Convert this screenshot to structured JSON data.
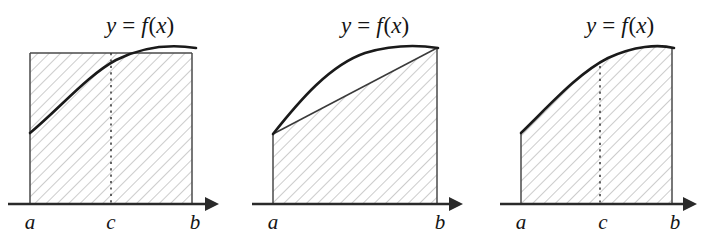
{
  "figure": {
    "background_color": "#ffffff",
    "curve_color": "#1a1a1a",
    "hatch_color": "#9a9a9a",
    "axis_color": "#2a2a2a"
  },
  "panels": [
    {
      "id": "left",
      "function_label": "y = f(x)",
      "function_label_parts": {
        "y": "y",
        "equals": "=",
        "f": "f",
        "open": "(",
        "x": "x",
        "close": ")"
      },
      "region_description": "rectangle of height f(c) over [a,b]",
      "axis_labels": [
        {
          "name": "a",
          "text": "a",
          "x": 30
        },
        {
          "name": "c",
          "text": "c",
          "x": 111
        },
        {
          "name": "b",
          "text": "b",
          "x": 195
        }
      ],
      "has_c_line": true,
      "geometry": {
        "x_a": 30,
        "x_c": 111,
        "x_b": 192,
        "y_base": 204,
        "y_top": 53,
        "curve": "M30,133 C60,108 88,75 116,60 C142,47 170,44 196,48",
        "axis_x_start": 8,
        "axis_x_end": 212,
        "axis_tip": 219
      }
    },
    {
      "id": "middle",
      "function_label": "y = f(x)",
      "function_label_parts": {
        "y": "y",
        "equals": "=",
        "f": "f",
        "open": "(",
        "x": "x",
        "close": ")"
      },
      "region_description": "trapezoid under chord from (a,f(a)) to (b,f(b))",
      "axis_labels": [
        {
          "name": "a",
          "text": "a",
          "x": 273
        },
        {
          "name": "b",
          "text": "b",
          "x": 440
        }
      ],
      "has_c_line": false,
      "geometry": {
        "x_a": 273,
        "x_b": 437,
        "y_base": 204,
        "y_fa": 134,
        "y_fb": 48,
        "curve": "M273,134 C300,100 330,65 365,53 C392,45 418,45 438,48",
        "axis_x_start": 252,
        "axis_x_end": 456,
        "axis_tip": 463
      }
    },
    {
      "id": "right",
      "function_label": "y = f(x)",
      "function_label_parts": {
        "y": "y",
        "equals": "=",
        "f": "f",
        "open": "(",
        "x": "x",
        "close": ")"
      },
      "region_description": "exact region under the curve over [a,b]",
      "axis_labels": [
        {
          "name": "a",
          "text": "a",
          "x": 521
        },
        {
          "name": "c",
          "text": "c",
          "x": 603
        },
        {
          "name": "b",
          "text": "b",
          "x": 675
        }
      ],
      "has_c_line": true,
      "geometry": {
        "x_a": 521,
        "x_c": 600,
        "x_b": 672,
        "y_base": 204,
        "y_fa": 133,
        "y_fb": 48,
        "curve": "M521,133 C548,107 578,73 608,58 C634,46 658,44 674,48",
        "axis_x_start": 500,
        "axis_x_end": 690,
        "axis_tip": 697
      }
    }
  ],
  "hatching": {
    "angle_degrees": 45,
    "spacing_px": 8,
    "stroke_width": 1
  }
}
